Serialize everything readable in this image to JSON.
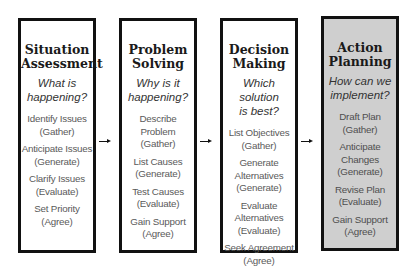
{
  "columns": [
    {
      "title_line1": "Situation",
      "title_line2": "Assessment",
      "question_line1": "What is",
      "question_line2": "happening?",
      "steps": [
        {
          "action": "Identify Issues",
          "phase": "(Gather)"
        },
        {
          "action": "Anticipate Issues",
          "phase": "(Generate)"
        },
        {
          "action": "Clarify Issues",
          "phase": "(Evaluate)"
        },
        {
          "action": "Set Priority",
          "phase": "(Agree)"
        }
      ]
    },
    {
      "title_line1": "Problem",
      "title_line2": "Solving",
      "question_line1": "Why is it",
      "question_line2": "happening?",
      "steps": [
        {
          "action": "Describe Problem",
          "phase": "(Gather)"
        },
        {
          "action": "List Causes",
          "phase": "(Generate)"
        },
        {
          "action": "Test Causes",
          "phase": "(Evaluate)"
        },
        {
          "action": "Gain Support",
          "phase": "(Agree)"
        }
      ]
    },
    {
      "title_line1": "Decision",
      "title_line2": "Making",
      "question_line1": "Which solution",
      "question_line2": "is best?",
      "steps": [
        {
          "action": "List Objectives",
          "phase": "(Gather)"
        },
        {
          "action": "Generate Alternatives",
          "phase": "(Generate)"
        },
        {
          "action": "Evaluate Alternatives",
          "phase": "(Evaluate)"
        },
        {
          "action": "Seek Agreement",
          "phase": "(Agree)"
        }
      ]
    },
    {
      "title_line1": "Action",
      "title_line2": "Planning",
      "question_line1": "How can we",
      "question_line2": "implement?",
      "highlighted": true,
      "steps": [
        {
          "action": "Draft Plan",
          "phase": "(Gather)"
        },
        {
          "action": "Anticipate Changes",
          "phase": "(Generate)"
        },
        {
          "action": "Revise Plan",
          "phase": "(Evaluate)"
        },
        {
          "action": "Gain Support",
          "phase": "(Agree)"
        }
      ]
    }
  ],
  "colors": {
    "border": "#111111",
    "highlight_fill": "#cfcfcf",
    "background": "#ffffff"
  }
}
